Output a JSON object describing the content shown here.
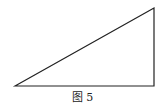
{
  "figure": {
    "caption": "图 5",
    "shape": "right-triangle",
    "vertices": {
      "bottom_left": [
        15,
        86
      ],
      "bottom_right": [
        154,
        86
      ],
      "top_right": [
        154,
        8
      ]
    },
    "stroke_color": "#222222"
  }
}
